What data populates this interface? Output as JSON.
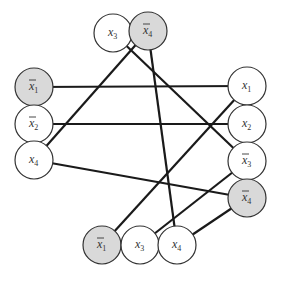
{
  "diagram": {
    "type": "graph",
    "colors": {
      "shaded_fill": "#d9d9d9",
      "plain_fill": "#ffffff",
      "edge": "#1a1a1a",
      "stroke": "#333333"
    },
    "node_radius": 19,
    "nodes": [
      {
        "id": "top-x3",
        "group": "top",
        "var": "x",
        "sub": "3",
        "negated": false,
        "shaded": false,
        "cx": 113,
        "cy": 33
      },
      {
        "id": "top-x4bar",
        "group": "top",
        "var": "x",
        "sub": "4",
        "negated": true,
        "shaded": true,
        "cx": 148,
        "cy": 31
      },
      {
        "id": "left-x1bar",
        "group": "left",
        "var": "x",
        "sub": "1",
        "negated": true,
        "shaded": true,
        "cx": 34,
        "cy": 87
      },
      {
        "id": "left-x2bar",
        "group": "left",
        "var": "x",
        "sub": "2",
        "negated": true,
        "shaded": false,
        "cx": 34,
        "cy": 124
      },
      {
        "id": "left-x4",
        "group": "left",
        "var": "x",
        "sub": "4",
        "negated": false,
        "shaded": false,
        "cx": 34,
        "cy": 160
      },
      {
        "id": "right-x1",
        "group": "right",
        "var": "x",
        "sub": "1",
        "negated": false,
        "shaded": false,
        "cx": 247,
        "cy": 86
      },
      {
        "id": "right-x2",
        "group": "right",
        "var": "x",
        "sub": "2",
        "negated": false,
        "shaded": false,
        "cx": 247,
        "cy": 124
      },
      {
        "id": "right-x3bar",
        "group": "right",
        "var": "x",
        "sub": "3",
        "negated": true,
        "shaded": false,
        "cx": 247,
        "cy": 161
      },
      {
        "id": "right-x4bar",
        "group": "right",
        "var": "x",
        "sub": "4",
        "negated": true,
        "shaded": true,
        "cx": 247,
        "cy": 198
      },
      {
        "id": "bottom-x1bar",
        "group": "bottom",
        "var": "x",
        "sub": "1",
        "negated": true,
        "shaded": true,
        "cx": 102,
        "cy": 245
      },
      {
        "id": "bottom-x3",
        "group": "bottom",
        "var": "x",
        "sub": "3",
        "negated": false,
        "shaded": false,
        "cx": 140,
        "cy": 245
      },
      {
        "id": "bottom-x4",
        "group": "bottom",
        "var": "x",
        "sub": "4",
        "negated": false,
        "shaded": false,
        "cx": 177,
        "cy": 245
      }
    ],
    "edges": [
      {
        "from": "left-x1bar",
        "to": "right-x1"
      },
      {
        "from": "left-x2bar",
        "to": "right-x2"
      },
      {
        "from": "left-x4",
        "to": "right-x4bar"
      },
      {
        "from": "left-x4",
        "to": "top-x4bar"
      },
      {
        "from": "top-x3",
        "to": "right-x3bar"
      },
      {
        "from": "top-x4bar",
        "to": "bottom-x4"
      },
      {
        "from": "right-x1",
        "to": "bottom-x1bar"
      },
      {
        "from": "right-x3bar",
        "to": "bottom-x3"
      },
      {
        "from": "right-x4bar",
        "to": "bottom-x4"
      }
    ]
  }
}
